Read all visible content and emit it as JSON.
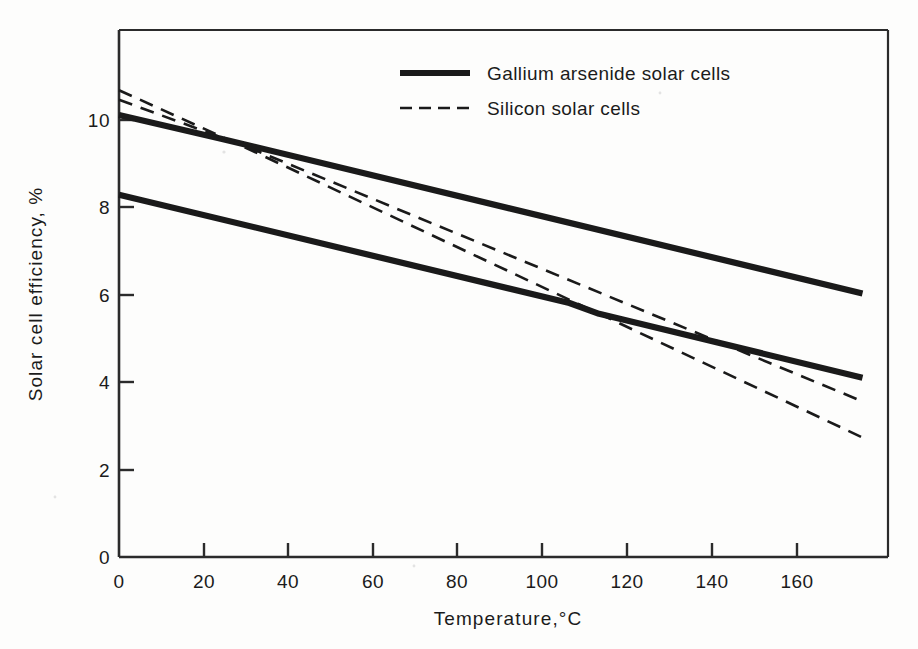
{
  "chart_data": {
    "type": "line",
    "title": "",
    "xlabel": "Temperature,°C",
    "ylabel": "Solar cell efficiency, %",
    "xlim": [
      0,
      181
    ],
    "ylim": [
      0,
      12.7
    ],
    "xticks": [
      0,
      20,
      40,
      60,
      80,
      100,
      120,
      140,
      160
    ],
    "yticks": [
      0,
      2,
      4,
      6,
      8,
      10
    ],
    "xtick_labels": [
      "0",
      "20",
      "40",
      "60",
      "80",
      "100",
      "120",
      "140",
      "160"
    ],
    "ytick_labels": [
      "0",
      "2",
      "4",
      "6",
      "8",
      "10"
    ],
    "grid": false,
    "legend_position": "upper-center",
    "series": [
      {
        "name": "Gallium arsenide solar cells (upper)",
        "style": "solid",
        "color": "#1a1a1a",
        "points": [
          [
            0,
            10.65
          ],
          [
            24,
            10.08
          ],
          [
            175,
            6.35
          ]
        ]
      },
      {
        "name": "Gallium arsenide solar cells (lower)",
        "style": "solid",
        "color": "#1a1a1a",
        "points": [
          [
            0,
            8.73
          ],
          [
            106,
            6.12
          ],
          [
            113,
            5.86
          ],
          [
            175,
            4.32
          ]
        ]
      },
      {
        "name": "Silicon solar cells (steeper)",
        "style": "dashed",
        "color": "#1a1a1a",
        "points": [
          [
            0,
            11.25
          ],
          [
            28,
            9.95
          ],
          [
            175,
            2.88
          ]
        ]
      },
      {
        "name": "Silicon solar cells (shallower)",
        "style": "dashed",
        "color": "#1a1a1a",
        "points": [
          [
            0,
            11.02
          ],
          [
            31,
            9.85
          ],
          [
            175,
            3.75
          ]
        ]
      }
    ]
  },
  "legend": {
    "entries": [
      {
        "label": "Gallium arsenide solar cells",
        "style": "solid"
      },
      {
        "label": "Silicon solar cells",
        "style": "dashed"
      }
    ]
  },
  "axes": {
    "x_label": "Temperature,°C",
    "y_label": "Solar cell efficiency, %",
    "x_ticks": [
      "0",
      "20",
      "40",
      "60",
      "80",
      "100",
      "120",
      "140",
      "160"
    ],
    "y_ticks": [
      "10",
      "8",
      "6",
      "4",
      "2",
      "0"
    ]
  },
  "colors": {
    "ink": "#1a1a1a",
    "frame": "#2b2b2b",
    "paper": "#fdfdfc"
  }
}
